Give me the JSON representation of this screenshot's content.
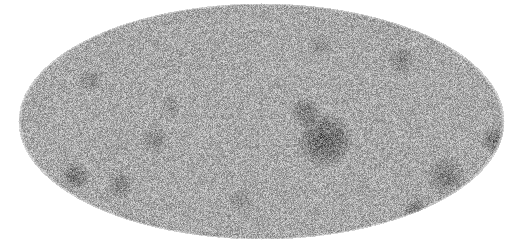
{
  "figure": {
    "type": "all-sky map",
    "projection": "mollweide",
    "colormap": "grayscale",
    "background": "#ffffff",
    "ellipse": {
      "cx": 261,
      "cy": 121,
      "rx": 243,
      "ry": 118
    },
    "base_gray": 168,
    "noise_amplitude": 70,
    "seed": 12345,
    "dark_regions": [
      {
        "x": 325,
        "y": 140,
        "r": 28,
        "strength": 70
      },
      {
        "x": 305,
        "y": 112,
        "r": 16,
        "strength": 45
      },
      {
        "x": 75,
        "y": 175,
        "r": 14,
        "strength": 55
      },
      {
        "x": 495,
        "y": 140,
        "r": 14,
        "strength": 55
      },
      {
        "x": 445,
        "y": 175,
        "r": 20,
        "strength": 45
      },
      {
        "x": 415,
        "y": 210,
        "r": 12,
        "strength": 50
      },
      {
        "x": 120,
        "y": 185,
        "r": 14,
        "strength": 40
      },
      {
        "x": 155,
        "y": 140,
        "r": 14,
        "strength": 35
      },
      {
        "x": 90,
        "y": 80,
        "r": 12,
        "strength": 30
      },
      {
        "x": 400,
        "y": 60,
        "r": 14,
        "strength": 35
      },
      {
        "x": 320,
        "y": 45,
        "r": 12,
        "strength": 30
      },
      {
        "x": 240,
        "y": 200,
        "r": 12,
        "strength": 30
      },
      {
        "x": 170,
        "y": 105,
        "r": 10,
        "strength": 25
      }
    ]
  }
}
